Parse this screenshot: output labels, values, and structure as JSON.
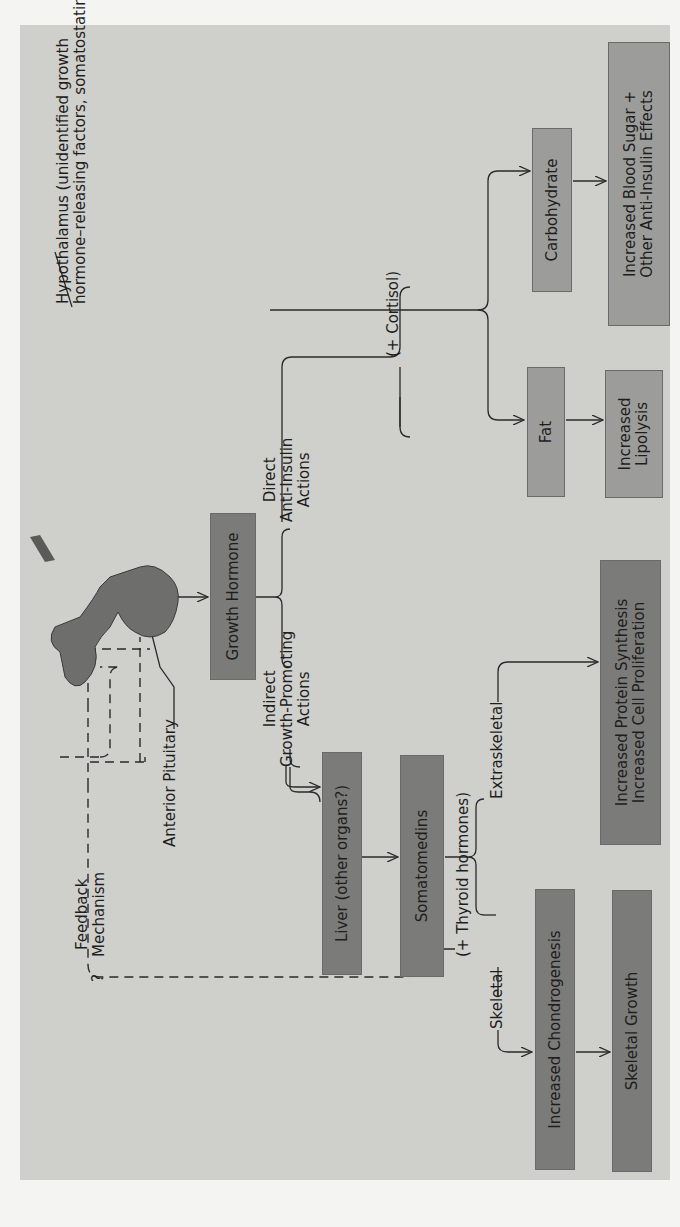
{
  "diagram": {
    "orientation": "rotated 90 degrees counterclockwise",
    "anatomy": {
      "hypothalamus_label": "Hypothalamus (unidentified growth",
      "hypothalamus_label_line2": "hormone–releasing factors, somatostatin)",
      "anterior_pituitary_label": "Anterior Pituitary"
    },
    "nodes": {
      "growth_hormone": "Growth Hormone",
      "liver": "Liver (other organs?)",
      "somatomedins": "Somatomedins",
      "fat": "Fat",
      "carbohydrate": "Carbohydrate",
      "increased_lipolysis_1": "Increased",
      "increased_lipolysis_2": "Lipolysis",
      "blood_sugar_1": "Increased Blood Sugar +",
      "blood_sugar_2": "Other Anti-Insulin Effects",
      "protein_synthesis_1": "Increased Protein Synthesis",
      "protein_synthesis_2": "Increased Cell Proliferation",
      "chondrogenesis": "Increased Chondrogenesis",
      "skeletal_growth": "Skeletal Growth"
    },
    "branch_labels": {
      "direct_1": "Direct",
      "direct_2": "Anti-Insulin",
      "direct_3": "Actions",
      "indirect_1": "Indirect",
      "indirect_2": "Growth-Promoting",
      "indirect_3": "Actions",
      "cortisol": "(+ Cortisol)",
      "thyroid": "(+ Thyroid hormones)",
      "skeletal": "Skeletal",
      "extraskeletal": "Extraskeletal"
    },
    "feedback": {
      "label_1": "Feedback",
      "label_2": "Mechanism",
      "question": "?"
    },
    "colors": {
      "background": "#cfcfcc",
      "box_dark": "#7b7b79",
      "box_light": "#9c9c9a",
      "line": "#2a2a2a"
    }
  }
}
